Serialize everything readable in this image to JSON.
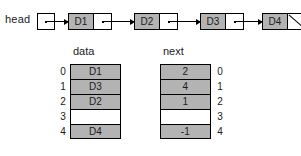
{
  "diagram": {
    "colors": {
      "fill_gray": "#b3b3b3",
      "empty_white": "#ffffff",
      "stroke": "#000000"
    }
  },
  "linked_list": {
    "head_label": "head",
    "head_pointer_icon": "pointer-dot-icon",
    "nodes": [
      {
        "data": "D1",
        "pointer_icon": "pointer-dot-icon",
        "is_null": false
      },
      {
        "data": "D2",
        "pointer_icon": "pointer-dot-icon",
        "is_null": false
      },
      {
        "data": "D3",
        "pointer_icon": "pointer-dot-icon",
        "is_null": false
      },
      {
        "data": "D4",
        "pointer_icon": "null-slash-icon",
        "is_null": true
      }
    ]
  },
  "arrays": {
    "data_column": {
      "header": "data",
      "indices": [
        "0",
        "1",
        "2",
        "3",
        "4"
      ],
      "values": [
        "D1",
        "D3",
        "D2",
        "",
        "D4"
      ]
    },
    "next_column": {
      "header": "next",
      "indices": [
        "0",
        "1",
        "2",
        "3",
        "4"
      ],
      "values": [
        "2",
        "4",
        "1",
        "",
        "-1"
      ]
    }
  }
}
